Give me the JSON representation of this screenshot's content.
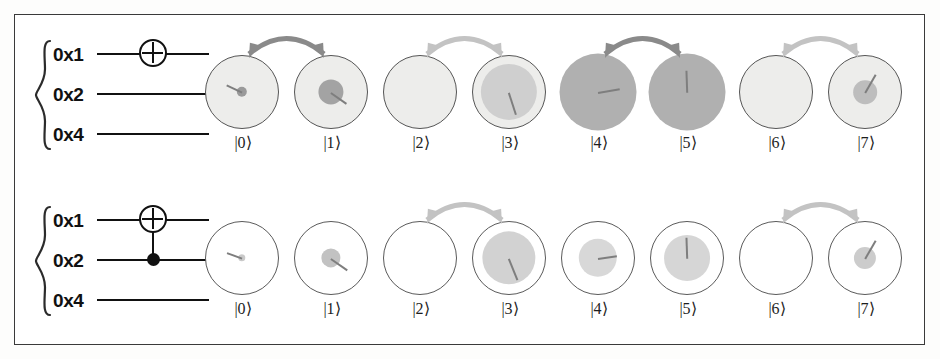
{
  "figure": {
    "type": "quantum-circuit-state-diagram",
    "background": "#ffffff",
    "frame_border_color": "#3a3a3a",
    "arrow_dark_color": "#8a8a8a",
    "arrow_light_color": "#c3c3c3",
    "outer_circle_stroke": "#5a5a5a",
    "inner_disc_color": "#b8b8b8",
    "hand_color": "#7e7e7e"
  },
  "rows": [
    {
      "name": "row-x-gate",
      "register": {
        "brace": "{",
        "wires": [
          {
            "label": "0x1",
            "gate": "x-gate"
          },
          {
            "label": "0x2",
            "gate": "none"
          },
          {
            "label": "0x4",
            "gate": "none"
          }
        ],
        "gate_symbol": "⊕",
        "gate_name": "not-gate"
      },
      "outer_fill": "#ededeb",
      "states": [
        {
          "ket": "|0⟩",
          "inner_radius_pct": 7,
          "inner_shade": "#9a9a9a",
          "hand_angle_deg": 205,
          "hand_length_pct": 46
        },
        {
          "ket": "|1⟩",
          "inner_radius_pct": 17,
          "inner_shade": "#a3a3a3",
          "hand_angle_deg": 35,
          "hand_length_pct": 52
        },
        {
          "ket": "|2⟩",
          "inner_radius_pct": 0,
          "inner_shade": "#bcbcbc",
          "hand_angle_deg": 0,
          "hand_length_pct": 0
        },
        {
          "ket": "|3⟩",
          "inner_radius_pct": 38,
          "inner_shade": "#cfcfcf",
          "hand_angle_deg": 72,
          "hand_length_pct": 62
        },
        {
          "ket": "|4⟩",
          "inner_radius_pct": 52,
          "inner_shade": "#b0b0b0",
          "hand_angle_deg": 350,
          "hand_length_pct": 60
        },
        {
          "ket": "|5⟩",
          "inner_radius_pct": 52,
          "inner_shade": "#b0b0b0",
          "hand_angle_deg": 268,
          "hand_length_pct": 60
        },
        {
          "ket": "|6⟩",
          "inner_radius_pct": 0,
          "inner_shade": "#bcbcbc",
          "hand_angle_deg": 0,
          "hand_length_pct": 0
        },
        {
          "ket": "|7⟩",
          "inner_radius_pct": 16,
          "inner_shade": "#bdbdbd",
          "hand_angle_deg": 300,
          "hand_length_pct": 58
        }
      ],
      "arrows": [
        {
          "from": "|0⟩",
          "to": "|1⟩",
          "tone": "dark",
          "double_headed": true
        },
        {
          "from": "|2⟩",
          "to": "|3⟩",
          "tone": "light",
          "double_headed": true
        },
        {
          "from": "|4⟩",
          "to": "|5⟩",
          "tone": "dark",
          "double_headed": true
        },
        {
          "from": "|6⟩",
          "to": "|7⟩",
          "tone": "light",
          "double_headed": true
        }
      ]
    },
    {
      "name": "row-cnot-gate",
      "register": {
        "brace": "{",
        "wires": [
          {
            "label": "0x1",
            "gate": "x-gate"
          },
          {
            "label": "0x2",
            "gate": "control-dot"
          },
          {
            "label": "0x4",
            "gate": "none"
          }
        ],
        "gate_symbol": "⊕",
        "gate_name": "cnot-gate"
      },
      "outer_fill": "#ffffff",
      "states": [
        {
          "ket": "|0⟩",
          "inner_radius_pct": 5,
          "inner_shade": "#c9c9c9",
          "hand_angle_deg": 200,
          "hand_length_pct": 44
        },
        {
          "ket": "|1⟩",
          "inner_radius_pct": 13,
          "inner_shade": "#c2c2c2",
          "hand_angle_deg": 35,
          "hand_length_pct": 55
        },
        {
          "ket": "|2⟩",
          "inner_radius_pct": 0,
          "inner_shade": "#dcdcdc",
          "hand_angle_deg": 0,
          "hand_length_pct": 0
        },
        {
          "ket": "|3⟩",
          "inner_radius_pct": 36,
          "inner_shade": "#d2d2d2",
          "hand_angle_deg": 68,
          "hand_length_pct": 62
        },
        {
          "ket": "|4⟩",
          "inner_radius_pct": 26,
          "inner_shade": "#d8d8d8",
          "hand_angle_deg": 352,
          "hand_length_pct": 52
        },
        {
          "ket": "|5⟩",
          "inner_radius_pct": 31,
          "inner_shade": "#d6d6d6",
          "hand_angle_deg": 268,
          "hand_length_pct": 58
        },
        {
          "ket": "|6⟩",
          "inner_radius_pct": 0,
          "inner_shade": "#dcdcdc",
          "hand_angle_deg": 0,
          "hand_length_pct": 0
        },
        {
          "ket": "|7⟩",
          "inner_radius_pct": 15,
          "inner_shade": "#cccccc",
          "hand_angle_deg": 300,
          "hand_length_pct": 58
        }
      ],
      "arrows": [
        {
          "from": "|2⟩",
          "to": "|3⟩",
          "tone": "light",
          "double_headed": true
        },
        {
          "from": "|6⟩",
          "to": "|7⟩",
          "tone": "light",
          "double_headed": true
        }
      ]
    }
  ]
}
